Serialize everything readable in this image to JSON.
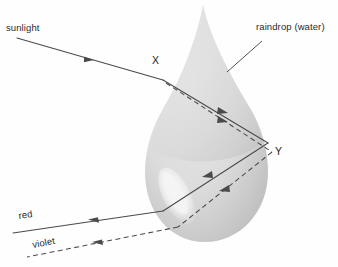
{
  "figure": {
    "type": "optics-ray-diagram",
    "title_visible": false,
    "background_color": "#fefefe",
    "width": 338,
    "height": 267
  },
  "labels": {
    "sunlight": "sunlight",
    "raindrop": "raindrop (water)",
    "point_entry": "X",
    "point_reflection": "Y",
    "ray_red": "red",
    "ray_violet": "violet"
  },
  "colors": {
    "drop_fill_light": "#e2e2e2",
    "drop_fill_mid": "#d2d2d2",
    "drop_fill_dark": "#c3c3c3",
    "drop_highlight": "#f2f2f2",
    "ray_stroke": "#4a4a4a",
    "label_text": "#2b2b2b",
    "background": "#fefefe"
  },
  "geometry": {
    "drop_apex": [
      203,
      5
    ],
    "drop_bottom": [
      205,
      242
    ],
    "drop_left": [
      146,
      190
    ],
    "drop_right": [
      266,
      188
    ],
    "point_X": [
      163,
      80
    ],
    "point_Y": [
      268,
      143
    ],
    "sunlight_origin": [
      17,
      38
    ],
    "red_exit": [
      163,
      211
    ],
    "red_end": [
      13,
      233
    ],
    "violet_exit": [
      178,
      227
    ],
    "violet_end": [
      27,
      257
    ]
  },
  "optics": {
    "medium": "water",
    "phenomena": [
      "refraction at X",
      "total internal reflection at Y",
      "refraction on exit",
      "dispersion"
    ],
    "ray_styles": {
      "red": "solid",
      "violet": "dashed"
    },
    "description": "A ray of sunlight enters a spherical raindrop at point X, refracts and disperses, reflects internally at point Y, then refracts again on leaving the drop, emerging as separated red and violet rays."
  }
}
